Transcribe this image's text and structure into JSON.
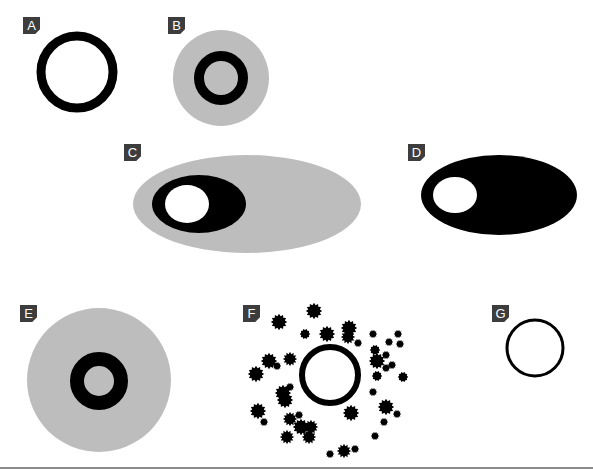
{
  "panels": [
    {
      "id": "A",
      "label": "A",
      "description": "Thick black ring, white interior"
    },
    {
      "id": "B",
      "label": "B",
      "description": "Thick black ring centered inside a gray disc"
    },
    {
      "id": "C",
      "label": "C",
      "description": "Black ellipse with white hole, offset left inside a large gray ellipse"
    },
    {
      "id": "D",
      "label": "D",
      "description": "Solid black ellipse with white hole offset left"
    },
    {
      "id": "E",
      "label": "E",
      "description": "Small thick black ring centered inside a large gray disc"
    },
    {
      "id": "F",
      "label": "F",
      "description": "Black ring surrounded by scattered black spiky dots"
    },
    {
      "id": "G",
      "label": "G",
      "description": "Thin black circle outline"
    }
  ],
  "colors": {
    "label_bg": "#3d3d3d",
    "label_text": "#ffffff",
    "black": "#000000",
    "gray_fill": "#bdbdbd",
    "divider": "#8a8a8a"
  }
}
